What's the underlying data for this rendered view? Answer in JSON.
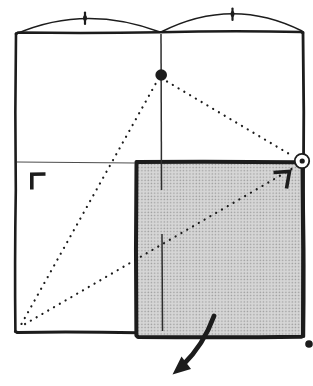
{
  "figure": {
    "type": "origami-fold-diagram",
    "canvas": {
      "width": 313,
      "height": 386,
      "background": "#ffffff"
    },
    "colors": {
      "ink": "#1c1c1c",
      "thin": "#4d4d4d",
      "crease": "#2e2e2e",
      "shade-base": "#d6d6d6",
      "shade-dot": "#9a9a9a",
      "paper": "#ffffff"
    },
    "paths": {
      "outer_top": "M 16 34 L 18 32.5 Q 90 33.5 160 32.2 Q 233 30.5 301 32 L 303 33",
      "outer_left": "M 16 33.5 Q 14.8 112 15.8 190 Q 14.6 264 15.4 331.5",
      "outer_right": "M 303 32.5 Q 304.3 112 303.4 192 Q 304.6 268 303.8 336.5",
      "outer_bottom": "M 15.4 331.5 L 17 332.4 Q 78 331.6 138 332.8 Q 220 332.2 302 333.5",
      "shaded_square": "M 136.5 162 Q 216 161.2 296 162.3 L 302.5 163.5 Q 303.6 250 303 335.5 L 301.5 336.8 Q 219 337.8 138 336.9 L 136.4 335.5 Q 135.5 249 136.5 163.5 Z",
      "arc_left": "M 16 34 Q 85 4 160 32",
      "arc_right": "M 161 32 Q 232 -4 302 31",
      "tick_left_line": "M 85 12.5 L 85 24",
      "tick_left_blob": "M 85 14.8 a 2 3.2 0 1 0 0.01 0",
      "tick_right_line": "M 232.5 8.5 L 232.5 20",
      "tick_right_blob": "M 232.5 10.8 a 2 3.2 0 1 0 0.01 0",
      "h_crease": "M 17 162 L 135 163",
      "v_crease_upper": "M 161 34 L 161.5 190",
      "v_crease_lower": "M 162 234 L 162.5 331",
      "dotted_apex_to_corner": "M 155.5 84 L 19.5 327.5",
      "dotted_apex_to_circle": "M 167 81.5 L 293.5 156.5",
      "dotted_circle_to_corner": "M 291.5 169 L 22.5 325.5",
      "apex_dot": "M 155.4 75 a 5.8 5.8 0 1 0 11.6 0 a 5.8 5.8 0 1 0 -11.6 0",
      "circle_marker": "M 294.8 161 a 7.2 7.2 0 1 0 14.4 0 a 7.2 7.2 0 1 0 -14.4 0",
      "circle_marker_dot": "M 299.6 161 a 2.6 2.6 0 1 0 5.2 0 a 2.6 2.6 0 1 0 -5.2 0",
      "corner_mark_left": "M 45.5 174 L 31.8 174.2 L 31.8 189.5",
      "corner_mark_right": "M 273.5 172.5 L 289.5 171.5 L 286.5 188.5",
      "arrow_shaft": "M 214 316 Q 203.5 345 182.5 365.5",
      "arrow_head": "M 172.5 374.5 L 191 369 L 181.5 356.5 Z",
      "bottom_right_dot": "M 305.2 344 a 3.8 3.8 0 1 0 7.6 0 a 3.8 3.8 0 1 0 -7.6 0"
    }
  }
}
